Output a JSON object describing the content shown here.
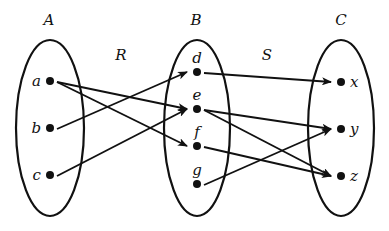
{
  "diagram": {
    "type": "relation-composition",
    "sets": [
      {
        "id": "A",
        "label": "A",
        "cx": 50,
        "cy": 128,
        "rx": 34,
        "ry": 88,
        "label_x": 49,
        "label_y": 25,
        "elements": [
          {
            "id": "a",
            "label": "a",
            "x": 50,
            "y": 81,
            "label_pos": "left"
          },
          {
            "id": "b",
            "label": "b",
            "x": 50,
            "y": 128,
            "label_pos": "left"
          },
          {
            "id": "c",
            "label": "c",
            "x": 50,
            "y": 175,
            "label_pos": "left"
          }
        ]
      },
      {
        "id": "B",
        "label": "B",
        "cx": 197,
        "cy": 128,
        "rx": 33,
        "ry": 88,
        "label_x": 196,
        "label_y": 25,
        "elements": [
          {
            "id": "d",
            "label": "d",
            "x": 197,
            "y": 72,
            "label_pos": "top"
          },
          {
            "id": "e",
            "label": "e",
            "x": 197,
            "y": 109,
            "label_pos": "top"
          },
          {
            "id": "f",
            "label": "f",
            "x": 197,
            "y": 146,
            "label_pos": "top"
          },
          {
            "id": "g",
            "label": "g",
            "x": 197,
            "y": 184,
            "label_pos": "top"
          }
        ]
      },
      {
        "id": "C",
        "label": "C",
        "cx": 341,
        "cy": 128,
        "rx": 33,
        "ry": 88,
        "label_x": 341,
        "label_y": 25,
        "elements": [
          {
            "id": "x",
            "label": "x",
            "x": 341,
            "y": 82,
            "label_pos": "right"
          },
          {
            "id": "y",
            "label": "y",
            "x": 341,
            "y": 129,
            "label_pos": "right"
          },
          {
            "id": "z",
            "label": "z",
            "x": 341,
            "y": 176,
            "label_pos": "right"
          }
        ]
      }
    ],
    "relations": [
      {
        "id": "R",
        "label": "R",
        "label_x": 121,
        "label_y": 60,
        "pairs": [
          [
            "a",
            "e"
          ],
          [
            "a",
            "f"
          ],
          [
            "b",
            "d"
          ],
          [
            "c",
            "e"
          ]
        ]
      },
      {
        "id": "S",
        "label": "S",
        "label_x": 267,
        "label_y": 60,
        "pairs": [
          [
            "d",
            "x"
          ],
          [
            "e",
            "y"
          ],
          [
            "e",
            "z"
          ],
          [
            "f",
            "z"
          ],
          [
            "g",
            "y"
          ]
        ]
      }
    ],
    "colors": {
      "stroke": "#111111",
      "background": "#ffffff"
    }
  }
}
